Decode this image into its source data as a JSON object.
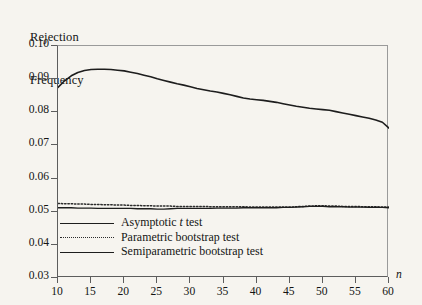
{
  "chart_data": {
    "type": "line",
    "title": "",
    "ylabel": "Rejection\nFrequency",
    "ylabel_line1": "Rejection",
    "ylabel_line2": "Frequency",
    "xlabel": "n",
    "xlim": [
      10,
      60
    ],
    "ylim": [
      0.03,
      0.1
    ],
    "grid": false,
    "legend_position": "lower-left-inside",
    "ytick_labels": [
      "0.10",
      "0.09",
      "0.08",
      "0.07",
      "0.06",
      "0.05",
      "0.04",
      "0.03"
    ],
    "ytick_values": [
      0.1,
      0.09,
      0.08,
      0.07,
      0.06,
      0.05,
      0.04,
      0.03
    ],
    "xtick_labels": [
      "10",
      "15",
      "20",
      "25",
      "30",
      "35",
      "40",
      "45",
      "50",
      "55",
      "60"
    ],
    "xtick_values": [
      10,
      15,
      20,
      25,
      30,
      35,
      40,
      45,
      50,
      55,
      60
    ],
    "x": [
      10,
      11,
      12,
      13,
      14,
      15,
      16,
      17,
      18,
      19,
      20,
      21,
      22,
      23,
      24,
      25,
      26,
      27,
      28,
      29,
      30,
      31,
      32,
      33,
      34,
      35,
      36,
      37,
      38,
      39,
      40,
      41,
      42,
      43,
      44,
      45,
      46,
      47,
      48,
      49,
      50,
      51,
      52,
      53,
      54,
      55,
      56,
      57,
      58,
      59,
      60
    ],
    "series": [
      {
        "name": "Asymptotic t test",
        "style": "solid",
        "color": "#1d1d1d",
        "width": 1.6,
        "values": [
          0.0875,
          0.0895,
          0.091,
          0.092,
          0.0926,
          0.0929,
          0.093,
          0.093,
          0.0929,
          0.0927,
          0.0925,
          0.0921,
          0.0917,
          0.0912,
          0.0907,
          0.0901,
          0.0896,
          0.0891,
          0.0886,
          0.0882,
          0.0877,
          0.0872,
          0.0868,
          0.0864,
          0.0861,
          0.0857,
          0.0853,
          0.0848,
          0.0843,
          0.084,
          0.0838,
          0.0836,
          0.0833,
          0.083,
          0.0826,
          0.0822,
          0.0818,
          0.0815,
          0.0812,
          0.081,
          0.0808,
          0.0806,
          0.0802,
          0.0798,
          0.0794,
          0.079,
          0.0786,
          0.0782,
          0.0777,
          0.077,
          0.0752
        ]
      },
      {
        "name": "Parametric bootstrap test",
        "style": "dotted",
        "color": "#2b2b2b",
        "width": 1.5,
        "values": [
          0.0525,
          0.0524,
          0.0524,
          0.0523,
          0.0523,
          0.0522,
          0.0522,
          0.0521,
          0.0521,
          0.052,
          0.052,
          0.0519,
          0.0519,
          0.0518,
          0.0518,
          0.0517,
          0.0517,
          0.0517,
          0.0516,
          0.0516,
          0.0516,
          0.0516,
          0.0516,
          0.0515,
          0.0515,
          0.0515,
          0.0515,
          0.0515,
          0.0515,
          0.0514,
          0.0514,
          0.0514,
          0.0514,
          0.0514,
          0.0514,
          0.0514,
          0.0515,
          0.0516,
          0.0517,
          0.0518,
          0.0518,
          0.0517,
          0.0517,
          0.0516,
          0.0516,
          0.0516,
          0.0515,
          0.0515,
          0.0515,
          0.0514,
          0.0514
        ]
      },
      {
        "name": "Semiparametric bootstrap test",
        "style": "solid",
        "color": "#1d1d1d",
        "width": 1.3,
        "values": [
          0.0512,
          0.0512,
          0.0512,
          0.0511,
          0.0511,
          0.0511,
          0.051,
          0.051,
          0.051,
          0.051,
          0.051,
          0.051,
          0.0509,
          0.0509,
          0.0509,
          0.0508,
          0.0508,
          0.0509,
          0.051,
          0.051,
          0.051,
          0.051,
          0.051,
          0.051,
          0.0511,
          0.0511,
          0.0511,
          0.0511,
          0.0512,
          0.0512,
          0.0512,
          0.0512,
          0.0512,
          0.0512,
          0.0513,
          0.0513,
          0.0514,
          0.0515,
          0.0516,
          0.0516,
          0.0516,
          0.0515,
          0.0515,
          0.0515,
          0.0514,
          0.0514,
          0.0514,
          0.0513,
          0.0513,
          0.0513,
          0.0512
        ]
      }
    ],
    "legend": [
      {
        "label_prefix": "Asymptotic ",
        "label_italic": "t",
        "label_suffix": " test",
        "style": "solid-thick"
      },
      {
        "label_prefix": "Parametric bootstrap test",
        "label_italic": "",
        "label_suffix": "",
        "style": "dotted"
      },
      {
        "label_prefix": "Semiparametric bootstrap test",
        "label_italic": "",
        "label_suffix": "",
        "style": "solid"
      }
    ]
  }
}
